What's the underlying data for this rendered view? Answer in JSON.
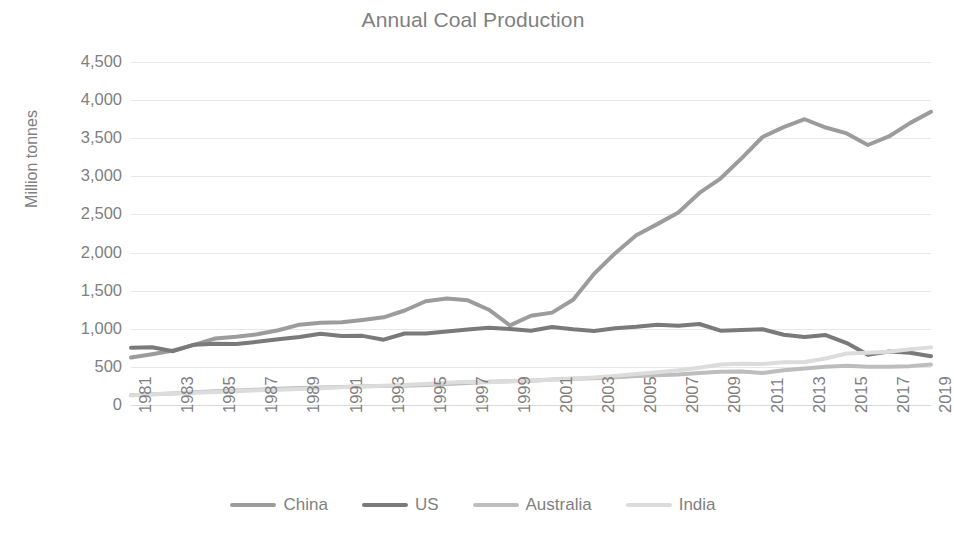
{
  "chart_data": {
    "type": "line",
    "title": "Annual Coal Production",
    "xlabel": "",
    "ylabel": "Million tonnes",
    "ylim": [
      0,
      4500
    ],
    "ytick_labels": [
      "4,500",
      "4,000",
      "3,500",
      "3,000",
      "2,500",
      "2,000",
      "1,500",
      "1,000",
      "500",
      "0"
    ],
    "ytick_values": [
      4500,
      4000,
      3500,
      3000,
      2500,
      2000,
      1500,
      1000,
      500,
      0
    ],
    "grid": true,
    "legend_position": "bottom",
    "x": [
      1981,
      1982,
      1983,
      1984,
      1985,
      1986,
      1987,
      1988,
      1989,
      1990,
      1991,
      1992,
      1993,
      1994,
      1995,
      1996,
      1997,
      1998,
      1999,
      2000,
      2001,
      2002,
      2003,
      2004,
      2005,
      2006,
      2007,
      2008,
      2009,
      2010,
      2011,
      2012,
      2013,
      2014,
      2015,
      2016,
      2017,
      2018,
      2019
    ],
    "xtick_labels": [
      "1981",
      "1983",
      "1985",
      "1987",
      "1989",
      "1991",
      "1993",
      "1995",
      "1997",
      "1999",
      "2001",
      "2003",
      "2005",
      "2007",
      "2009",
      "2011",
      "2013",
      "2015",
      "2017",
      "2019"
    ],
    "series": [
      {
        "name": "China",
        "color": "#9c9c9c",
        "values": [
          622,
          666,
          715,
          789,
          872,
          894,
          928,
          980,
          1054,
          1080,
          1087,
          1116,
          1150,
          1240,
          1361,
          1397,
          1373,
          1250,
          1045,
          1171,
          1212,
          1380,
          1722,
          1992,
          2226,
          2373,
          2526,
          2782,
          2971,
          3235,
          3516,
          3645,
          3749,
          3640,
          3563,
          3411,
          3523,
          3698,
          3846
        ],
        "estimated": true
      },
      {
        "name": "US",
        "color": "#7a7a7a",
        "values": [
          752,
          757,
          706,
          792,
          802,
          799,
          830,
          862,
          891,
          934,
          904,
          907,
          857,
          938,
          937,
          964,
          991,
          1012,
          998,
          974,
          1023,
          993,
          972,
          1008,
          1026,
          1053,
          1040,
          1063,
          975,
          983,
          993,
          922,
          893,
          918,
          813,
          660,
          702,
          686,
          640
        ],
        "estimated": true
      },
      {
        "name": "Australia",
        "color": "#bdbdbd",
        "values": [
          128,
          140,
          152,
          167,
          182,
          191,
          200,
          214,
          223,
          230,
          235,
          245,
          250,
          254,
          261,
          276,
          289,
          304,
          313,
          317,
          334,
          345,
          350,
          365,
          380,
          391,
          400,
          420,
          435,
          441,
          419,
          456,
          478,
          502,
          515,
          501,
          503,
          510,
          530
        ],
        "estimated": true
      },
      {
        "name": "India",
        "color": "#dcdcdc",
        "values": [
          128,
          140,
          150,
          161,
          172,
          181,
          193,
          200,
          209,
          220,
          232,
          243,
          254,
          262,
          276,
          292,
          306,
          299,
          310,
          322,
          332,
          349,
          362,
          382,
          406,
          430,
          455,
          490,
          530,
          540,
          539,
          560,
          565,
          610,
          675,
          685,
          700,
          731,
          756
        ],
        "estimated": true
      }
    ],
    "legend": [
      {
        "label": "China",
        "color": "#9c9c9c"
      },
      {
        "label": "US",
        "color": "#7a7a7a"
      },
      {
        "label": "Australia",
        "color": "#bdbdbd"
      },
      {
        "label": "India",
        "color": "#dcdcdc"
      }
    ],
    "axis_color": "#d9d9d9",
    "grid_color": "#e8e8e8",
    "text_color": "#7f7f7f"
  }
}
